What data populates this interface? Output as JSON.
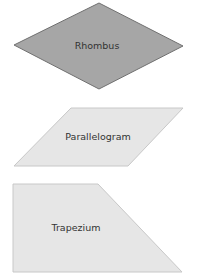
{
  "shapes": [
    {
      "name": "rhombus",
      "label": "Rhombus",
      "fill": "#a6a6a6",
      "stroke": "#707070",
      "points": "99,3 183,46 99,89 14,45",
      "label_x": 97,
      "label_y": 49
    },
    {
      "name": "parallelogram",
      "label": "Parallelogram",
      "fill": "#e6e6e6",
      "stroke": "#c8c8c8",
      "points": "71,108 183,108 128,166 14,166",
      "label_x": 98,
      "label_y": 140
    },
    {
      "name": "trapezium",
      "label": "Trapezium",
      "fill": "#e6e6e6",
      "stroke": "#c8c8c8",
      "points": "13,184 98,184 182,272 13,272",
      "label_x": 76,
      "label_y": 231
    }
  ]
}
